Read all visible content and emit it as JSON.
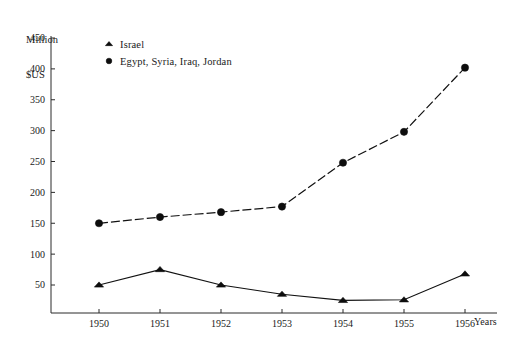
{
  "chart_data": {
    "type": "line",
    "title": "",
    "ylabel_line1": "Million",
    "ylabel_line2": "$US",
    "xlabel": "Years",
    "categories": [
      "1950",
      "1951",
      "1952",
      "1953",
      "1954",
      "1955",
      "1956"
    ],
    "x": [
      1950,
      1951,
      1952,
      1953,
      1954,
      1955,
      1956
    ],
    "xlim": [
      1949.2,
      1956.6
    ],
    "ylim": [
      0,
      460
    ],
    "yticks": [
      50,
      100,
      150,
      200,
      250,
      300,
      350,
      400,
      450
    ],
    "ytick_labels": [
      "50",
      "100",
      "150",
      "200",
      "250",
      "300",
      "350",
      "400",
      "450"
    ],
    "grid": false,
    "legend_position": "top-left-inside",
    "series": [
      {
        "name": "Israel",
        "marker": "triangle",
        "linestyle": "solid",
        "color": "#111111",
        "values": [
          50,
          75,
          50,
          35,
          25,
          26,
          68
        ]
      },
      {
        "name": "Egypt, Syria, Iraq, Jordan",
        "marker": "circle",
        "linestyle": "dashed",
        "color": "#111111",
        "values": [
          150,
          160,
          168,
          177,
          248,
          298,
          402
        ]
      }
    ]
  },
  "legend": {
    "entries": [
      {
        "label": "Israel",
        "marker": "triangle"
      },
      {
        "label": "Egypt, Syria, Iraq, Jordan",
        "marker": "circle"
      }
    ]
  },
  "colors": {
    "ink": "#1a1a1a",
    "axis": "#2a2a2a",
    "series": "#111111",
    "background": "#ffffff"
  }
}
